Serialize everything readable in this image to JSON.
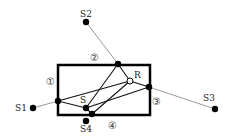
{
  "diagram": {
    "room": {
      "x": 58,
      "y": 65,
      "width": 92,
      "height": 50,
      "stroke": "#000000",
      "stroke_width": 2.5
    },
    "walls": [
      {
        "id": "wall-1",
        "label": "①",
        "x": 46,
        "y": 85
      },
      {
        "id": "wall-2",
        "label": "②",
        "x": 90,
        "y": 61
      },
      {
        "id": "wall-3",
        "label": "③",
        "x": 152,
        "y": 105
      },
      {
        "id": "wall-4",
        "label": "④",
        "x": 108,
        "y": 129
      }
    ],
    "points": {
      "S": {
        "label": "S",
        "x": 86,
        "y": 108,
        "label_x": 80,
        "label_y": 103
      },
      "R": {
        "label": "R",
        "x": 130,
        "y": 81,
        "label_x": 134,
        "label_y": 78,
        "hollow": true
      },
      "S1": {
        "label": "S1",
        "x": 33,
        "y": 108,
        "label_x": 15,
        "label_y": 111
      },
      "S2": {
        "label": "S2",
        "x": 86,
        "y": 22,
        "label_x": 80,
        "label_y": 17
      },
      "S3": {
        "label": "S3",
        "x": 215,
        "y": 109,
        "label_x": 203,
        "label_y": 101
      },
      "S4": {
        "label": "S4",
        "x": 86,
        "y": 121,
        "label_x": 80,
        "label_y": 132
      }
    },
    "reflection_points": [
      {
        "id": "P1",
        "x": 58,
        "y": 101
      },
      {
        "id": "P2",
        "x": 118,
        "y": 64
      },
      {
        "id": "P3",
        "x": 149,
        "y": 87
      },
      {
        "id": "P4",
        "x": 92,
        "y": 114
      }
    ],
    "image_source_lines": [
      {
        "from": "S1",
        "to": "P1"
      },
      {
        "from": "S2",
        "to": "P2"
      },
      {
        "from": "S3",
        "to": "P3"
      }
    ],
    "ray_paths": [
      {
        "x1": 58,
        "y1": 101,
        "x2": 130,
        "y2": 81
      },
      {
        "x1": 58,
        "y1": 101,
        "x2": 86,
        "y2": 108
      },
      {
        "x1": 86,
        "y1": 108,
        "x2": 118,
        "y2": 64
      },
      {
        "x1": 118,
        "y1": 64,
        "x2": 130,
        "y2": 81
      },
      {
        "x1": 86,
        "y1": 108,
        "x2": 149,
        "y2": 87
      },
      {
        "x1": 149,
        "y1": 87,
        "x2": 130,
        "y2": 81
      },
      {
        "x1": 86,
        "y1": 108,
        "x2": 92,
        "y2": 114
      },
      {
        "x1": 92,
        "y1": 114,
        "x2": 130,
        "y2": 81
      }
    ],
    "colors": {
      "room": "#000000",
      "rays": "#111111",
      "source_lines": "#999999",
      "dots": "#000000"
    }
  }
}
